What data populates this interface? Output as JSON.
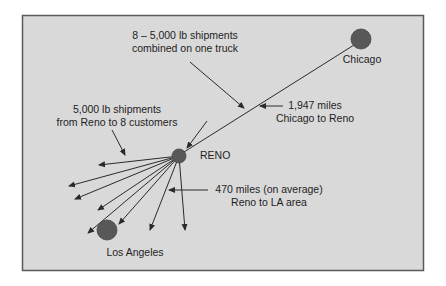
{
  "diagram": {
    "colors": {
      "background": "#ffffff",
      "panel_fill": "#d9d9d9",
      "panel_border": "#5a5a5a",
      "node_fill": "#585858",
      "line": "#2a2a2a",
      "text": "#1e1e1e"
    },
    "nodes": {
      "chicago": {
        "label": "Chicago",
        "cx": 361,
        "cy": 39,
        "r": 10
      },
      "reno": {
        "label": "RENO",
        "cx": 179,
        "cy": 156,
        "r": 7
      },
      "los_angeles": {
        "label": "Los Angeles",
        "cx": 107,
        "cy": 230,
        "r": 10
      }
    },
    "annotations": {
      "combined": {
        "line1": "8 – 5,000 lb shipments",
        "line2": "combined on one truck"
      },
      "chicago_reno": {
        "line1": "1,947 miles",
        "line2": "Chicago to Reno"
      },
      "reno_customers": {
        "line1": "5,000 lb shipments",
        "line2": "from Reno to 8 customers"
      },
      "reno_la": {
        "line1": "470 miles (on average)",
        "line2": "Reno to LA area"
      }
    },
    "delivery_arrows": [
      {
        "x": 99,
        "y": 165
      },
      {
        "x": 69,
        "y": 186
      },
      {
        "x": 75,
        "y": 199
      },
      {
        "x": 98,
        "y": 210
      },
      {
        "x": 88,
        "y": 233
      },
      {
        "x": 119,
        "y": 224
      },
      {
        "x": 150,
        "y": 230
      },
      {
        "x": 185,
        "y": 230
      }
    ]
  }
}
